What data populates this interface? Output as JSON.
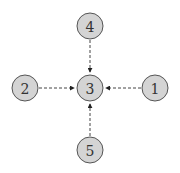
{
  "diagram": {
    "type": "directed-graph",
    "nodes": [
      {
        "id": "1",
        "label": "1",
        "x": 155,
        "y": 88
      },
      {
        "id": "2",
        "label": "2",
        "x": 25,
        "y": 88
      },
      {
        "id": "3",
        "label": "3",
        "x": 90,
        "y": 88
      },
      {
        "id": "4",
        "label": "4",
        "x": 90,
        "y": 26
      },
      {
        "id": "5",
        "label": "5",
        "x": 90,
        "y": 150
      }
    ],
    "edges": [
      {
        "from": "4",
        "to": "3",
        "style": "dashed"
      },
      {
        "from": "2",
        "to": "3",
        "style": "dashed"
      },
      {
        "from": "1",
        "to": "3",
        "style": "dashed"
      },
      {
        "from": "5",
        "to": "3",
        "style": "dashed"
      }
    ],
    "colors": {
      "node_fill": "#d4d4d4",
      "node_stroke": "#555555",
      "edge": "#444444"
    }
  }
}
